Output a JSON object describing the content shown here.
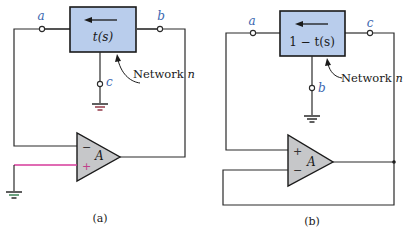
{
  "figure": {
    "panels": [
      {
        "id": "a",
        "caption": "(a)",
        "network_label": "Network n",
        "network_label_prefix": "Network ",
        "network_label_var": "n",
        "transfer_function": "t(s)",
        "nodes": {
          "left": "a",
          "right": "b",
          "bottom": "c"
        },
        "opamp": {
          "label": "A",
          "inverting": "−",
          "noninverting": "+",
          "top_input": "−",
          "bottom_input": "+"
        },
        "grounded": [
          "c",
          "noninverting-input"
        ]
      },
      {
        "id": "b",
        "caption": "(b)",
        "network_label": "Network n",
        "network_label_prefix": "Network ",
        "network_label_var": "n",
        "transfer_function": "1 − t(s)",
        "nodes": {
          "left": "a",
          "right": "c",
          "bottom": "b"
        },
        "opamp": {
          "label": "A",
          "inverting": "−",
          "noninverting": "+",
          "top_input": "+",
          "bottom_input": "−"
        },
        "grounded": [
          "b"
        ]
      }
    ],
    "colors": {
      "network_box_fill": "#b9cdec",
      "opamp_fill": "#c6c7c9",
      "node_label": "#3a66b0",
      "wire": "#2a2a2a",
      "highlight_wire": "#d63a9a",
      "ground_accent": "#8a2a3a"
    }
  }
}
